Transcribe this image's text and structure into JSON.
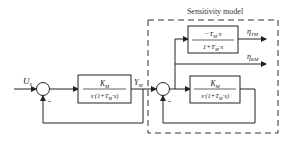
{
  "diagram": {
    "title": "Sensitivity model",
    "input": {
      "symbol": "U",
      "subscript": "s"
    },
    "output": {
      "symbol": "Y",
      "subscript": "M"
    },
    "left_sum": {
      "minus_sign": "-"
    },
    "right_sum": {
      "minus_sign": "-"
    },
    "plant_block": {
      "numerator": {
        "symbol": "K",
        "subscript": "M"
      },
      "denominator": {
        "prefix": "s·(1+T",
        "subscript": "M",
        "suffix": "·s)"
      }
    },
    "sensitivity_block_TM": {
      "numerator": {
        "prefix": "−T",
        "subscript": "M",
        "suffix": "·s"
      },
      "denominator": {
        "prefix": "1+T",
        "subscript": "M",
        "suffix": "·s"
      }
    },
    "sensitivity_block_KM": {
      "numerator": {
        "symbol": "K",
        "subscript": "M"
      },
      "denominator": {
        "prefix": "s·(1+T",
        "subscript": "M",
        "suffix": "·s)"
      }
    },
    "outputs": [
      {
        "symbol": "η",
        "subscript": "TM"
      },
      {
        "symbol": "η",
        "subscript": "KM"
      }
    ],
    "colors": {
      "line": "#222222",
      "dash": "#333333",
      "background": "#ffffff"
    }
  }
}
